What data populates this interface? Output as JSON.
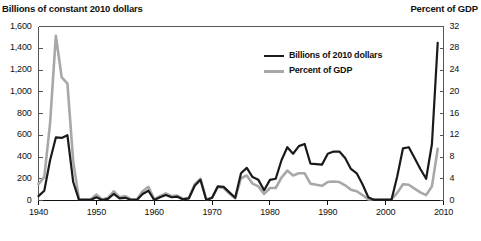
{
  "chart_data": {
    "type": "line",
    "title": "",
    "left_axis_title": "Billions of constant 2010 dollars",
    "right_axis_title": "Percent of GDP",
    "xlabel": "",
    "grid": false,
    "legend_position": "inside-top-right",
    "xlim": [
      1940,
      2010
    ],
    "x_ticks": [
      "1940",
      "1950",
      "1960",
      "1970",
      "1980",
      "1990",
      "2000",
      "2010"
    ],
    "x_tick_values": [
      1940,
      1950,
      1960,
      1970,
      1980,
      1990,
      2000,
      2010
    ],
    "ylim": [
      0,
      1600
    ],
    "y_ticks": [
      "0",
      "200",
      "400",
      "600",
      "800",
      "1,000",
      "1,200",
      "1,400",
      "1,600"
    ],
    "y_tick_values": [
      0,
      200,
      400,
      600,
      800,
      1000,
      1200,
      1400,
      1600
    ],
    "ylim_right": [
      0,
      32
    ],
    "y_ticks_right": [
      "0",
      "4",
      "8",
      "12",
      "16",
      "20",
      "24",
      "28",
      "32"
    ],
    "y_tick_values_right": [
      0,
      4,
      8,
      12,
      16,
      20,
      24,
      28,
      32
    ],
    "colors": {
      "series_billions": "#1a1a1a",
      "series_percent": "#a8a8a8",
      "axis": "#555555",
      "background": "#ffffff"
    },
    "x": [
      1940,
      1941,
      1942,
      1943,
      1944,
      1945,
      1946,
      1947,
      1948,
      1949,
      1950,
      1951,
      1952,
      1953,
      1954,
      1955,
      1956,
      1957,
      1958,
      1959,
      1960,
      1961,
      1962,
      1963,
      1964,
      1965,
      1966,
      1967,
      1968,
      1969,
      1970,
      1971,
      1972,
      1973,
      1974,
      1975,
      1976,
      1977,
      1978,
      1979,
      1980,
      1981,
      1982,
      1983,
      1984,
      1985,
      1986,
      1987,
      1988,
      1989,
      1990,
      1991,
      1992,
      1993,
      1994,
      1995,
      1996,
      1997,
      1998,
      1999,
      2000,
      2001,
      2002,
      2003,
      2004,
      2005,
      2006,
      2007,
      2008,
      2009
    ],
    "series": [
      {
        "name": "Billions of 2010 dollars",
        "axis": "left",
        "color": "#1a1a1a",
        "values": [
          40,
          90,
          370,
          580,
          575,
          600,
          170,
          5,
          5,
          5,
          30,
          5,
          15,
          60,
          20,
          25,
          5,
          5,
          60,
          90,
          5,
          30,
          50,
          30,
          35,
          10,
          20,
          135,
          190,
          5,
          25,
          130,
          125,
          75,
          25,
          250,
          300,
          215,
          190,
          95,
          190,
          200,
          370,
          490,
          430,
          500,
          520,
          340,
          335,
          330,
          430,
          450,
          450,
          390,
          290,
          250,
          150,
          30,
          5,
          5,
          5,
          5,
          220,
          480,
          490,
          390,
          290,
          200,
          520,
          1450
        ]
      },
      {
        "name": "Percent of GDP",
        "axis": "right",
        "color": "#a8a8a8",
        "values": [
          3.0,
          4.3,
          14.2,
          30.3,
          22.7,
          21.5,
          7.2,
          0.2,
          0.2,
          0.2,
          1.1,
          0.2,
          0.5,
          1.7,
          0.6,
          0.8,
          0.2,
          0.2,
          1.7,
          2.5,
          0.2,
          0.8,
          1.3,
          0.8,
          0.9,
          0.3,
          0.5,
          3.0,
          4.0,
          0.2,
          0.5,
          2.5,
          2.3,
          1.3,
          0.4,
          4.1,
          4.6,
          3.1,
          2.6,
          1.2,
          2.3,
          2.3,
          4.2,
          5.5,
          4.6,
          5.0,
          5.0,
          3.1,
          2.9,
          2.7,
          3.4,
          3.5,
          3.4,
          2.8,
          2.0,
          1.7,
          1.0,
          0.2,
          0.2,
          0.2,
          0.2,
          0.2,
          1.4,
          3.0,
          2.9,
          2.2,
          1.5,
          1.0,
          2.6,
          9.5
        ]
      }
    ],
    "legend": [
      {
        "label": "Billions of 2010 dollars",
        "color": "#1a1a1a"
      },
      {
        "label": "Percent of GDP",
        "color": "#a8a8a8"
      }
    ]
  }
}
